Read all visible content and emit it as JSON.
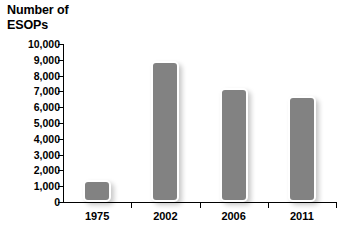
{
  "chart_data": {
    "type": "bar",
    "title": "Number of\nESOPs",
    "xlabel": "",
    "ylabel": "Number of ESOPs",
    "categories": [
      "1975",
      "2002",
      "2006",
      "2011"
    ],
    "values": [
      1400,
      8900,
      7200,
      6700
    ],
    "ylim": [
      0,
      10000
    ],
    "ytick_labels": [
      "10,000",
      "9,000",
      "8,000",
      "7,000",
      "6,000",
      "5,000",
      "4,000",
      "3,000",
      "2,000",
      "1,000",
      "0"
    ],
    "ytick_values": [
      10000,
      9000,
      8000,
      7000,
      6000,
      5000,
      4000,
      3000,
      2000,
      1000,
      0
    ],
    "grid": false,
    "legend": false,
    "series": [
      {
        "name": "ESOPs",
        "values": [
          1400,
          8900,
          7200,
          6700
        ]
      }
    ],
    "bar_color": "#828282",
    "background_color": "#ffffff",
    "axis_color": "#000000"
  }
}
